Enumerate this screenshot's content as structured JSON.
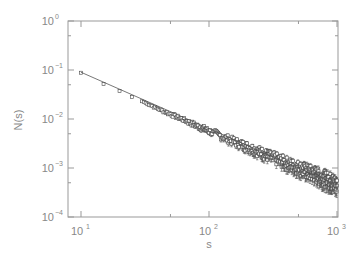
{
  "chart_data": {
    "type": "scatter",
    "title": "",
    "xlabel": "s",
    "ylabel": "N(s)",
    "xscale": "log",
    "yscale": "log",
    "xlim": [
      10,
      1000
    ],
    "ylim": [
      0.0001,
      1
    ],
    "x_ticks": [
      {
        "base": "10",
        "exp": "1",
        "value": 10
      },
      {
        "base": "10",
        "exp": "2",
        "value": 100
      },
      {
        "base": "10",
        "exp": "3",
        "value": 1000
      }
    ],
    "y_ticks": [
      {
        "base": "10",
        "exp": "0",
        "value": 1
      },
      {
        "base": "10",
        "exp": "−1",
        "value": 0.1
      },
      {
        "base": "10",
        "exp": "−2",
        "value": 0.01
      },
      {
        "base": "10",
        "exp": "−3",
        "value": 0.001
      },
      {
        "base": "10",
        "exp": "−4",
        "value": 0.0001
      }
    ],
    "grid": false,
    "legend": null,
    "marker": "open-square",
    "error_bars": true,
    "fit_line": {
      "type": "power-law",
      "x": [
        10,
        1000
      ],
      "y": [
        0.09,
        0.00045
      ],
      "exponent": -1.15
    },
    "series": [
      {
        "name": "N(s)",
        "x": [
          10,
          15,
          20,
          25,
          30,
          35,
          40,
          45,
          50,
          55,
          60,
          65,
          70,
          80,
          90,
          100,
          120,
          140,
          160,
          180,
          200,
          250,
          300,
          350,
          400,
          450,
          500,
          600,
          700,
          800,
          900,
          1000
        ],
        "y": [
          0.088,
          0.052,
          0.037,
          0.028,
          0.023,
          0.019,
          0.016,
          0.014,
          0.0125,
          0.0112,
          0.0102,
          0.0093,
          0.0085,
          0.0073,
          0.0064,
          0.0057,
          0.0047,
          0.0039,
          0.0034,
          0.003,
          0.0027,
          0.0021,
          0.0017,
          0.00145,
          0.00125,
          0.0011,
          0.001,
          0.00082,
          0.0007,
          0.0006,
          0.00053,
          0.00045
        ]
      }
    ]
  }
}
